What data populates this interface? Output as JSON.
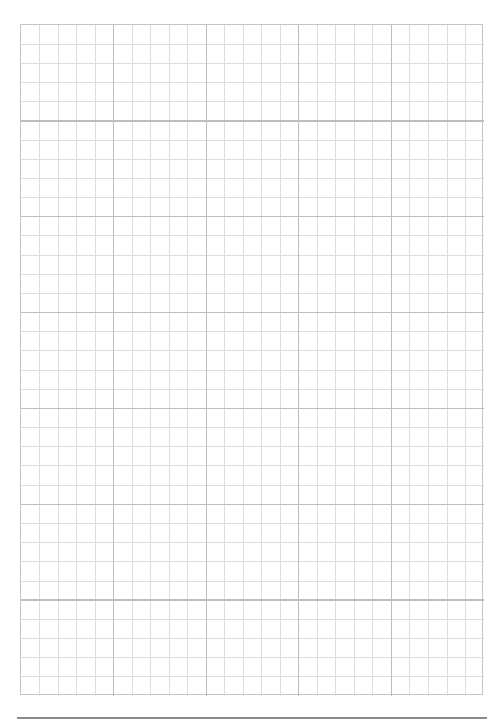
{
  "page": {
    "type": "graph-paper",
    "background": "#ffffff"
  },
  "grid": {
    "major_columns": 5,
    "major_rows": 7,
    "minor_per_major": 5,
    "minor_line_color": "#dddddd",
    "major_line_color": "#bdbdbd",
    "border_color": "#c4c4c4"
  },
  "footer": {
    "rule_color": "#8a8a8a"
  }
}
